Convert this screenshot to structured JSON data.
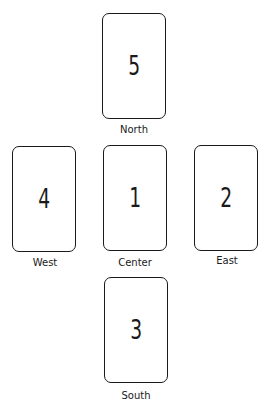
{
  "diagram": {
    "type": "card-spread-layout",
    "positions": [
      {
        "id": "north",
        "number": "5",
        "label": "North"
      },
      {
        "id": "west",
        "number": "4",
        "label": "West"
      },
      {
        "id": "center",
        "number": "1",
        "label": "Center"
      },
      {
        "id": "east",
        "number": "2",
        "label": "East"
      },
      {
        "id": "south",
        "number": "3",
        "label": "South"
      }
    ]
  },
  "colors": {
    "stroke": "#1a1a1a",
    "background": "#ffffff"
  }
}
